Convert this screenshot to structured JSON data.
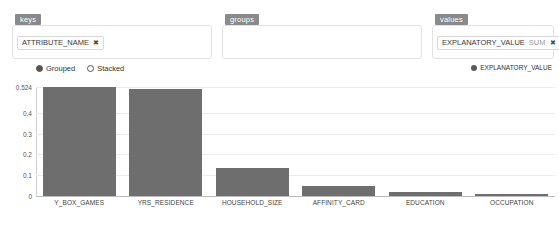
{
  "fields": [
    {
      "id": "keys",
      "label": "keys",
      "placeholder": "",
      "chips": [
        {
          "text": "ATTRIBUTE_NAME",
          "agg": "",
          "remove": "✖"
        }
      ]
    },
    {
      "id": "groups",
      "label": "groups",
      "placeholder": "",
      "chips": []
    },
    {
      "id": "values",
      "label": "values",
      "placeholder": "",
      "chips": [
        {
          "text": "EXPLANATORY_VALUE",
          "agg": "SUM",
          "remove": "✖"
        }
      ]
    }
  ],
  "chart_controls": {
    "mode_options": [
      {
        "label": "Grouped",
        "selected": true
      },
      {
        "label": "Stacked",
        "selected": false
      }
    ],
    "legend": [
      {
        "label": "EXPLANATORY_VALUE",
        "color": "#5a5a5a"
      }
    ]
  },
  "chart_data": {
    "type": "bar",
    "title": "",
    "xlabel": "",
    "ylabel": "",
    "grid": true,
    "legend_position": "top-right",
    "series_name": "EXPLANATORY_VALUE",
    "bar_color": "#6e6e6e",
    "categories": [
      "Y_BOX_GAMES",
      "YRS_RESIDENCE",
      "HOUSEHOLD_SIZE",
      "AFFINITY_CARD",
      "EDUCATION",
      "OCCUPATION"
    ],
    "values": [
      0.524,
      0.515,
      0.133,
      0.047,
      0.017,
      0.012
    ],
    "ylim": [
      0,
      0.524
    ],
    "yticks": [
      {
        "value": 0.524,
        "label": "0.524"
      },
      {
        "value": 0.4,
        "label": "0.4"
      },
      {
        "value": 0.3,
        "label": "0.3"
      },
      {
        "value": 0.2,
        "label": "0.2"
      },
      {
        "value": 0.1,
        "label": "0.1"
      },
      {
        "value": 0,
        "label": "0"
      }
    ]
  }
}
